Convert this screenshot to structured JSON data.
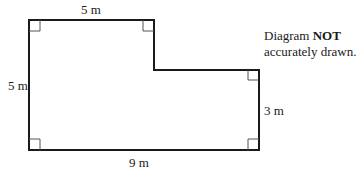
{
  "diagram": {
    "type": "L-shaped composite rectangle",
    "labels": {
      "top": "5 m",
      "left": "5 m",
      "right": "3 m",
      "bottom": "9 m"
    },
    "note": {
      "prefix": "Diagram ",
      "emphasis": "NOT",
      "suffix": "accurately drawn."
    },
    "colors": {
      "outline": "#1a1a1a",
      "right_angle_marker": "#555555"
    }
  }
}
